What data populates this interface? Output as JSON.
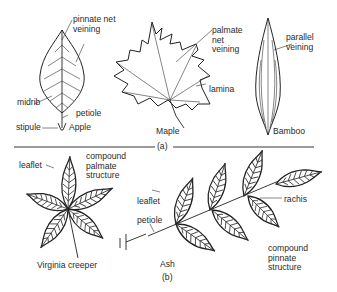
{
  "figure": {
    "part_a": {
      "marker": "(a)",
      "leaves": [
        {
          "name": "Apple",
          "labels": [
            "pinnate net veining",
            "midrib",
            "petiole",
            "stipule"
          ]
        },
        {
          "name": "Maple",
          "labels": [
            "palmate net veining",
            "lamina"
          ]
        },
        {
          "name": "Bamboo",
          "labels": [
            "parallel veining"
          ]
        }
      ]
    },
    "part_b": {
      "marker": "(b)",
      "leaves": [
        {
          "name": "Virginia creeper",
          "labels": [
            "leaflet",
            "compound palmate structure"
          ]
        },
        {
          "name": "Ash",
          "labels": [
            "leaflet",
            "petiole",
            "rachis",
            "compound pinnate structure"
          ]
        }
      ]
    }
  },
  "text": {
    "apple_veining": "pinnate net\nveining",
    "apple_midrib": "midrib",
    "apple_petiole": "petiole",
    "apple_stipule": "stipule",
    "apple_name": "Apple",
    "maple_veining": "palmate\nnet\nveining",
    "maple_lamina": "lamina",
    "maple_name": "Maple",
    "bamboo_veining": "parallel\nveining",
    "bamboo_name": "Bamboo",
    "marker_a": "(a)",
    "vc_leaflet": "leaflet",
    "vc_structure": "compound\npalmate\nstructure",
    "vc_name": "Virginia creeper",
    "ash_leaflet": "leaflet",
    "ash_petiole": "petiole",
    "ash_rachis": "rachis",
    "ash_structure": "compound\npinnate\nstructure",
    "ash_name": "Ash",
    "marker_b": "(b)"
  }
}
